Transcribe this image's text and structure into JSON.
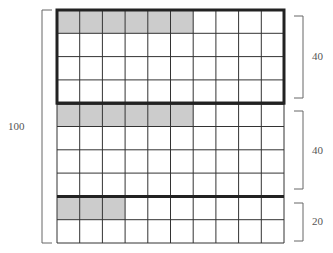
{
  "diagram": {
    "type": "grid-proportion",
    "grid": {
      "rows": 10,
      "cols": 10,
      "x": 57,
      "y": 10,
      "width": 227,
      "height": 233,
      "line_color": "#333333",
      "shade_color": "#cccccc"
    },
    "shaded_cells": [
      {
        "row": 0,
        "count": 6
      },
      {
        "row": 4,
        "count": 6
      },
      {
        "row": 8,
        "count": 3
      }
    ],
    "groups": [
      {
        "name": "group-1",
        "start_row": 0,
        "end_row": 4,
        "label": "40",
        "bold_box": true
      },
      {
        "name": "group-2",
        "start_row": 4,
        "end_row": 8,
        "label": "40",
        "bold_box": false
      },
      {
        "name": "group-3",
        "start_row": 8,
        "end_row": 10,
        "label": "20",
        "bold_box": false
      }
    ],
    "bold_divider_rows": [
      4,
      8
    ],
    "total": {
      "label": "100"
    }
  },
  "labels": {
    "total": "100",
    "group_1": "40",
    "group_2": "40",
    "group_3": "20"
  }
}
